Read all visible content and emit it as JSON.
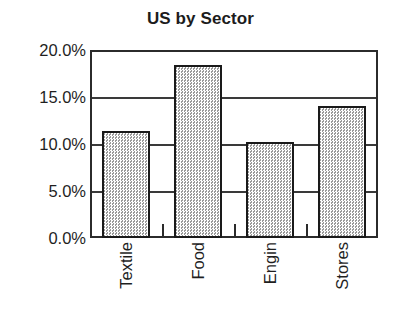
{
  "chart_data": {
    "type": "bar",
    "title": "US by Sector",
    "xlabel": "",
    "ylabel": "",
    "categories": [
      "Textile",
      "Food",
      "Engin",
      "Stores"
    ],
    "values": [
      11.4,
      18.4,
      10.2,
      14.0
    ],
    "value_labels": [
      "11.4%",
      "18.4%",
      "10.2%",
      "14.0%"
    ],
    "ylim": [
      0,
      20
    ],
    "ytick_values": [
      0,
      5,
      10,
      15,
      20
    ],
    "ytick_labels": [
      "0.0%",
      "5.0%",
      "10.0%",
      "15.0%",
      "20.0%"
    ],
    "grid": true,
    "grid_axis": "y",
    "legend": false,
    "legend_position": "none",
    "series": [
      {
        "name": "US by Sector",
        "values": [
          11.4,
          18.4,
          10.2,
          14.0
        ]
      }
    ],
    "colors": {
      "bar_fill": "#d6d6d6",
      "bar_pattern": "#9a9a9a",
      "bar_border": "#1a1a1a",
      "axis": "#2b2b2b",
      "gridline": "#3a3a3a",
      "text": "#1f1f1f",
      "title": "#1c1c1c",
      "background": "#ffffff"
    }
  }
}
